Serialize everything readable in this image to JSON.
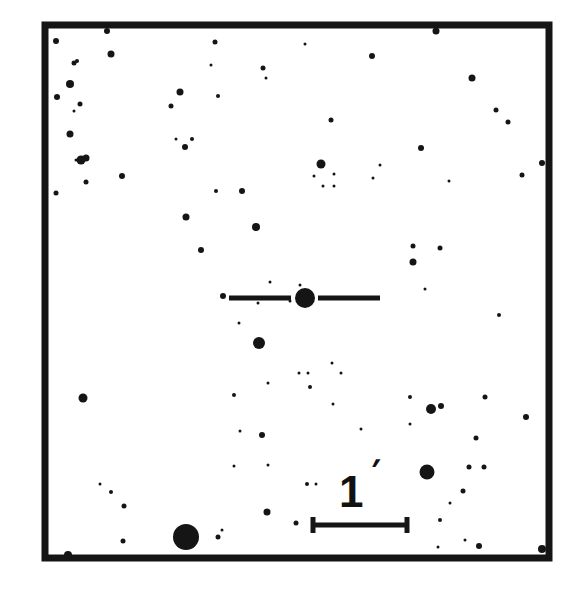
{
  "chart_data": {
    "type": "finder-chart",
    "title": "",
    "colors": {
      "ink": "#151515",
      "background": "#ffffff"
    },
    "frame": {
      "x": 45,
      "y": 25,
      "width": 504,
      "height": 533,
      "stroke": 7
    },
    "target": {
      "x": 305,
      "y": 298,
      "r": 10,
      "marker": {
        "left": {
          "x1": 229,
          "x2": 291
        },
        "right": {
          "x1": 318,
          "x2": 380
        },
        "y": 298,
        "thickness": 5
      }
    },
    "scale_bar": {
      "label": "1",
      "unit_symbol": "′",
      "x1": 313,
      "x2": 407,
      "y": 525,
      "cap_height": 16,
      "thickness": 5
    },
    "stars": [
      [
        56,
        41,
        3
      ],
      [
        107,
        31,
        3
      ],
      [
        111,
        54,
        3.5
      ],
      [
        74,
        63,
        2.5
      ],
      [
        77,
        61,
        2
      ],
      [
        70,
        84,
        4
      ],
      [
        57,
        97,
        3
      ],
      [
        80,
        104,
        2.5
      ],
      [
        74,
        111,
        1.5
      ],
      [
        70,
        134,
        3.5
      ],
      [
        81,
        160,
        4.5
      ],
      [
        86,
        158,
        3.5
      ],
      [
        76,
        160,
        1.5
      ],
      [
        86,
        182,
        2.5
      ],
      [
        56,
        193,
        2.5
      ],
      [
        122,
        176,
        3
      ],
      [
        180,
        92,
        3.5
      ],
      [
        171,
        106,
        2.5
      ],
      [
        185,
        147,
        3
      ],
      [
        176,
        139,
        1.5
      ],
      [
        192,
        139,
        2
      ],
      [
        215,
        42,
        2.5
      ],
      [
        211,
        65,
        1.5
      ],
      [
        218,
        96,
        2
      ],
      [
        242,
        191,
        3
      ],
      [
        216,
        191,
        2
      ],
      [
        186,
        217,
        3.5
      ],
      [
        201,
        250,
        3
      ],
      [
        256,
        227,
        4
      ],
      [
        263,
        68,
        2.5
      ],
      [
        266,
        78,
        1.5
      ],
      [
        305,
        44,
        1.5
      ],
      [
        331,
        120,
        2.5
      ],
      [
        321,
        164,
        4.5
      ],
      [
        314,
        176,
        1.5
      ],
      [
        334,
        174,
        1.5
      ],
      [
        323,
        186,
        1.5
      ],
      [
        334,
        186,
        1.5
      ],
      [
        372,
        56,
        3
      ],
      [
        380,
        165,
        1.5
      ],
      [
        373,
        178,
        1.5
      ],
      [
        436,
        31,
        3.5
      ],
      [
        472,
        78,
        3.5
      ],
      [
        496,
        110,
        2.5
      ],
      [
        508,
        122,
        2.5
      ],
      [
        542,
        163,
        3
      ],
      [
        522,
        175,
        2.5
      ],
      [
        421,
        148,
        3
      ],
      [
        449,
        181,
        1.5
      ],
      [
        413,
        246,
        2.5
      ],
      [
        413,
        262,
        3.5
      ],
      [
        440,
        248,
        2.5
      ],
      [
        425,
        289,
        1.5
      ],
      [
        499,
        315,
        2
      ],
      [
        259,
        343,
        6
      ],
      [
        223,
        296,
        3
      ],
      [
        290,
        301,
        1.5
      ],
      [
        270,
        282,
        1.5
      ],
      [
        300,
        285,
        1.5
      ],
      [
        239,
        323,
        1.5
      ],
      [
        258,
        303,
        1.5
      ],
      [
        268,
        383,
        1.5
      ],
      [
        299,
        373,
        1.5
      ],
      [
        308,
        373,
        1.5
      ],
      [
        332,
        363,
        1.5
      ],
      [
        341,
        373,
        1.5
      ],
      [
        310,
        387,
        2
      ],
      [
        333,
        404,
        1.5
      ],
      [
        83,
        398,
        4.5
      ],
      [
        234,
        395,
        2
      ],
      [
        240,
        431,
        1.5
      ],
      [
        262,
        435,
        3
      ],
      [
        234,
        466,
        1.5
      ],
      [
        100,
        484,
        1.5
      ],
      [
        111,
        492,
        2
      ],
      [
        124,
        506,
        2.5
      ],
      [
        123,
        541,
        2.5
      ],
      [
        186,
        537,
        13
      ],
      [
        218,
        537,
        2.5
      ],
      [
        222,
        530,
        1.5
      ],
      [
        267,
        512,
        3.5
      ],
      [
        268,
        465,
        1.5
      ],
      [
        296,
        523,
        2.5
      ],
      [
        307,
        484,
        2
      ],
      [
        316,
        484,
        1.5
      ],
      [
        361,
        429,
        1.5
      ],
      [
        431,
        409,
        5
      ],
      [
        441,
        406,
        3
      ],
      [
        410,
        397,
        2
      ],
      [
        410,
        424,
        1.5
      ],
      [
        485,
        397,
        2.5
      ],
      [
        476,
        438,
        2.5
      ],
      [
        526,
        417,
        3
      ],
      [
        427,
        472,
        7.5
      ],
      [
        469,
        467,
        2.5
      ],
      [
        484,
        467,
        2.5
      ],
      [
        463,
        491,
        2.5
      ],
      [
        450,
        503,
        1.5
      ],
      [
        440,
        520,
        2
      ],
      [
        479,
        546,
        3
      ],
      [
        438,
        547,
        1.5
      ],
      [
        465,
        540,
        1.5
      ],
      [
        68,
        555,
        4
      ],
      [
        542,
        549,
        4
      ]
    ]
  }
}
